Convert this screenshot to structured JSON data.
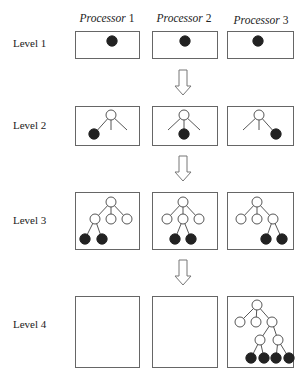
{
  "diagram": {
    "column_headers": [
      {
        "italic": "Processor",
        "num": " 1"
      },
      {
        "italic": "Processor",
        "num": " 2"
      },
      {
        "italic": "Processor",
        "num": " 3"
      }
    ],
    "row_labels": [
      "Level 1",
      "Level 2",
      "Level 3",
      "Level 4"
    ],
    "levels": [
      {
        "label": "Level 1",
        "processors": [
          {
            "nodes": [
              {
                "x": 112,
                "y": 41,
                "filled": true
              }
            ],
            "edges": []
          },
          {
            "nodes": [
              {
                "x": 185,
                "y": 41,
                "filled": true
              }
            ],
            "edges": []
          },
          {
            "nodes": [
              {
                "x": 258,
                "y": 41,
                "filled": true
              }
            ],
            "edges": []
          }
        ]
      },
      {
        "label": "Level 2",
        "processors": [
          {
            "nodes": [
              {
                "x": 111,
                "y": 115,
                "filled": false
              },
              {
                "x": 94,
                "y": 134,
                "filled": true
              }
            ],
            "edges": [
              [
                111,
                115,
                94,
                134
              ],
              [
                111,
                115,
                111,
                130
              ],
              [
                111,
                115,
                127,
                130
              ]
            ]
          },
          {
            "nodes": [
              {
                "x": 184,
                "y": 115,
                "filled": false
              },
              {
                "x": 184,
                "y": 134,
                "filled": true
              }
            ],
            "edges": [
              [
                184,
                115,
                168,
                130
              ],
              [
                184,
                115,
                184,
                134
              ],
              [
                184,
                115,
                200,
                130
              ]
            ]
          },
          {
            "nodes": [
              {
                "x": 259,
                "y": 115,
                "filled": false
              },
              {
                "x": 276,
                "y": 134,
                "filled": true
              }
            ],
            "edges": [
              [
                259,
                115,
                243,
                130
              ],
              [
                259,
                115,
                259,
                130
              ],
              [
                259,
                115,
                276,
                134
              ]
            ]
          }
        ]
      },
      {
        "label": "Level 3",
        "processors": [
          {
            "nodes": [
              {
                "x": 111,
                "y": 202,
                "filled": false
              },
              {
                "x": 95,
                "y": 219,
                "filled": false
              },
              {
                "x": 111,
                "y": 219,
                "filled": false
              },
              {
                "x": 127,
                "y": 219,
                "filled": false
              },
              {
                "x": 85,
                "y": 239,
                "filled": true
              },
              {
                "x": 102,
                "y": 239,
                "filled": true
              }
            ],
            "edges": [
              [
                111,
                202,
                95,
                219
              ],
              [
                111,
                202,
                111,
                219
              ],
              [
                111,
                202,
                127,
                219
              ],
              [
                95,
                219,
                85,
                239
              ],
              [
                95,
                219,
                102,
                239
              ]
            ]
          },
          {
            "nodes": [
              {
                "x": 183,
                "y": 202,
                "filled": false
              },
              {
                "x": 167,
                "y": 219,
                "filled": false
              },
              {
                "x": 183,
                "y": 219,
                "filled": false
              },
              {
                "x": 199,
                "y": 219,
                "filled": false
              },
              {
                "x": 175,
                "y": 239,
                "filled": true
              },
              {
                "x": 191,
                "y": 239,
                "filled": true
              }
            ],
            "edges": [
              [
                183,
                202,
                167,
                219
              ],
              [
                183,
                202,
                183,
                219
              ],
              [
                183,
                202,
                199,
                219
              ],
              [
                183,
                219,
                175,
                239
              ],
              [
                183,
                219,
                191,
                239
              ]
            ]
          },
          {
            "nodes": [
              {
                "x": 257,
                "y": 202,
                "filled": false
              },
              {
                "x": 241,
                "y": 219,
                "filled": false
              },
              {
                "x": 257,
                "y": 219,
                "filled": false
              },
              {
                "x": 273,
                "y": 219,
                "filled": false
              },
              {
                "x": 266,
                "y": 239,
                "filled": true
              },
              {
                "x": 282,
                "y": 239,
                "filled": true
              }
            ],
            "edges": [
              [
                257,
                202,
                241,
                219
              ],
              [
                257,
                202,
                257,
                219
              ],
              [
                257,
                202,
                273,
                219
              ],
              [
                273,
                219,
                266,
                239
              ],
              [
                273,
                219,
                282,
                239
              ]
            ]
          }
        ]
      },
      {
        "label": "Level 4",
        "processors": [
          {
            "nodes": [],
            "edges": []
          },
          {
            "nodes": [],
            "edges": []
          },
          {
            "nodes": [
              {
                "x": 257,
                "y": 305,
                "filled": false
              },
              {
                "x": 240,
                "y": 322,
                "filled": false
              },
              {
                "x": 256,
                "y": 322,
                "filled": false
              },
              {
                "x": 272,
                "y": 322,
                "filled": false
              },
              {
                "x": 260,
                "y": 340,
                "filled": false
              },
              {
                "x": 278,
                "y": 340,
                "filled": false
              },
              {
                "x": 251,
                "y": 358,
                "filled": true
              },
              {
                "x": 264,
                "y": 358,
                "filled": true
              },
              {
                "x": 276,
                "y": 358,
                "filled": true
              },
              {
                "x": 289,
                "y": 358,
                "filled": true
              }
            ],
            "edges": [
              [
                257,
                305,
                240,
                322
              ],
              [
                257,
                305,
                256,
                322
              ],
              [
                257,
                305,
                272,
                322
              ],
              [
                272,
                322,
                260,
                340
              ],
              [
                272,
                322,
                278,
                340
              ],
              [
                260,
                340,
                251,
                358
              ],
              [
                260,
                340,
                264,
                358
              ],
              [
                278,
                340,
                276,
                358
              ],
              [
                278,
                340,
                289,
                358
              ]
            ]
          }
        ]
      }
    ],
    "layout": {
      "columns_x": [
        75,
        152,
        227
      ],
      "box_widths": [
        64,
        65,
        66
      ],
      "rows": [
        {
          "y": 31,
          "h": 27,
          "label_y": 47
        },
        {
          "y": 106,
          "h": 39,
          "label_y": 129
        },
        {
          "y": 192,
          "h": 57,
          "label_y": 224
        },
        {
          "y": 296,
          "h": 71,
          "label_y": 328
        }
      ],
      "arrows_y": [
        70,
        156,
        260
      ],
      "arrow_x": 183,
      "node_r_open": 5,
      "node_r_filled": 5.2
    }
  }
}
